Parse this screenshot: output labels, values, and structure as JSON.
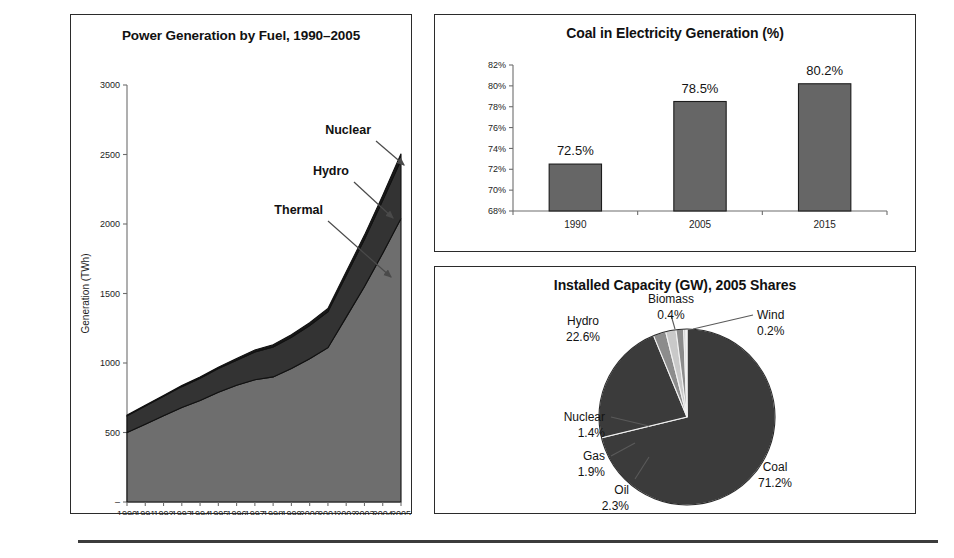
{
  "figure": {
    "background": "#ffffff",
    "footer_rule_color": "#3c3c3c"
  },
  "panels": {
    "area": {
      "title": "Power Generation by Fuel, 1990–2005",
      "ylabel": "Generation (TWh)",
      "callouts": [
        {
          "label": "Nuclear"
        },
        {
          "label": "Hydro"
        },
        {
          "label": "Thermal"
        }
      ]
    },
    "bar": {
      "title": "Coal in Electricity Generation (%)"
    },
    "pie": {
      "title": "Installed Capacity (GW), 2005 Shares"
    }
  },
  "chart_data": [
    {
      "id": "power-generation-by-fuel",
      "type": "area",
      "title": "Power Generation by Fuel, 1990–2005",
      "xlabel": "",
      "ylabel": "Generation (TWh)",
      "stacked": true,
      "grid": false,
      "legend": "annotations",
      "xlim": [
        1990,
        2005
      ],
      "ylim": [
        0,
        3000
      ],
      "ytick_labels": [
        "–",
        "500",
        "1000",
        "1500",
        "2000",
        "2500",
        "3000"
      ],
      "ytick_values": [
        0,
        500,
        1000,
        1500,
        2000,
        2500,
        3000
      ],
      "x": [
        1990,
        1991,
        1992,
        1993,
        1994,
        1995,
        1996,
        1997,
        1998,
        1999,
        2000,
        2001,
        2002,
        2003,
        2004,
        2005
      ],
      "xtick_labels": [
        "1990",
        "1991",
        "1992",
        "1993",
        "1994",
        "1995",
        "1996",
        "1997",
        "1998",
        "1999",
        "2000",
        "2001",
        "2002",
        "2003",
        "2004",
        "2005"
      ],
      "series": [
        {
          "name": "Thermal",
          "color": "#6e6e6e",
          "values": [
            500,
            560,
            620,
            680,
            730,
            790,
            840,
            880,
            900,
            960,
            1030,
            1110,
            1330,
            1550,
            1790,
            2040
          ]
        },
        {
          "name": "Hydro",
          "color": "#333333",
          "values": [
            120,
            130,
            140,
            150,
            160,
            170,
            180,
            200,
            215,
            225,
            240,
            260,
            300,
            340,
            380,
            420
          ]
        },
        {
          "name": "Nuclear",
          "color": "#1a1a1a",
          "values": [
            5,
            6,
            7,
            8,
            9,
            10,
            12,
            14,
            16,
            18,
            20,
            22,
            26,
            30,
            36,
            45
          ]
        }
      ],
      "annotations": [
        "Nuclear",
        "Hydro",
        "Thermal"
      ]
    },
    {
      "id": "coal-in-electricity-generation",
      "type": "bar",
      "title": "Coal in Electricity Generation (%)",
      "xlabel": "",
      "ylabel": "",
      "grid": false,
      "ylim": [
        68,
        82
      ],
      "ytick_labels": [
        "68%",
        "70%",
        "72%",
        "74%",
        "76%",
        "78%",
        "80%",
        "82%"
      ],
      "ytick_values": [
        68,
        70,
        72,
        74,
        76,
        78,
        80,
        82
      ],
      "categories": [
        "1990",
        "2005",
        "2015"
      ],
      "values": [
        72.5,
        78.5,
        80.2
      ],
      "value_labels": [
        "72.5%",
        "78.5%",
        "80.2%"
      ],
      "bar_color": "#666666"
    },
    {
      "id": "installed-capacity-shares-2005",
      "type": "pie",
      "title": "Installed Capacity (GW), 2005 Shares",
      "grid": false,
      "legend": "callout-labels",
      "labels": [
        "Coal",
        "Hydro",
        "Oil",
        "Gas",
        "Nuclear",
        "Biomass",
        "Wind"
      ],
      "values": [
        71.2,
        22.6,
        2.3,
        1.9,
        1.4,
        0.4,
        0.2
      ],
      "value_labels": [
        "71.2%",
        "22.6%",
        "2.3%",
        "1.9%",
        "1.4%",
        "0.4%",
        "0.2%"
      ],
      "colors": [
        "#3b3b3b",
        "#3b3b3b",
        "#8c8c8c",
        "#c9c9c9",
        "#8c8c8c",
        "#ffffff",
        "#ffffff"
      ]
    }
  ]
}
